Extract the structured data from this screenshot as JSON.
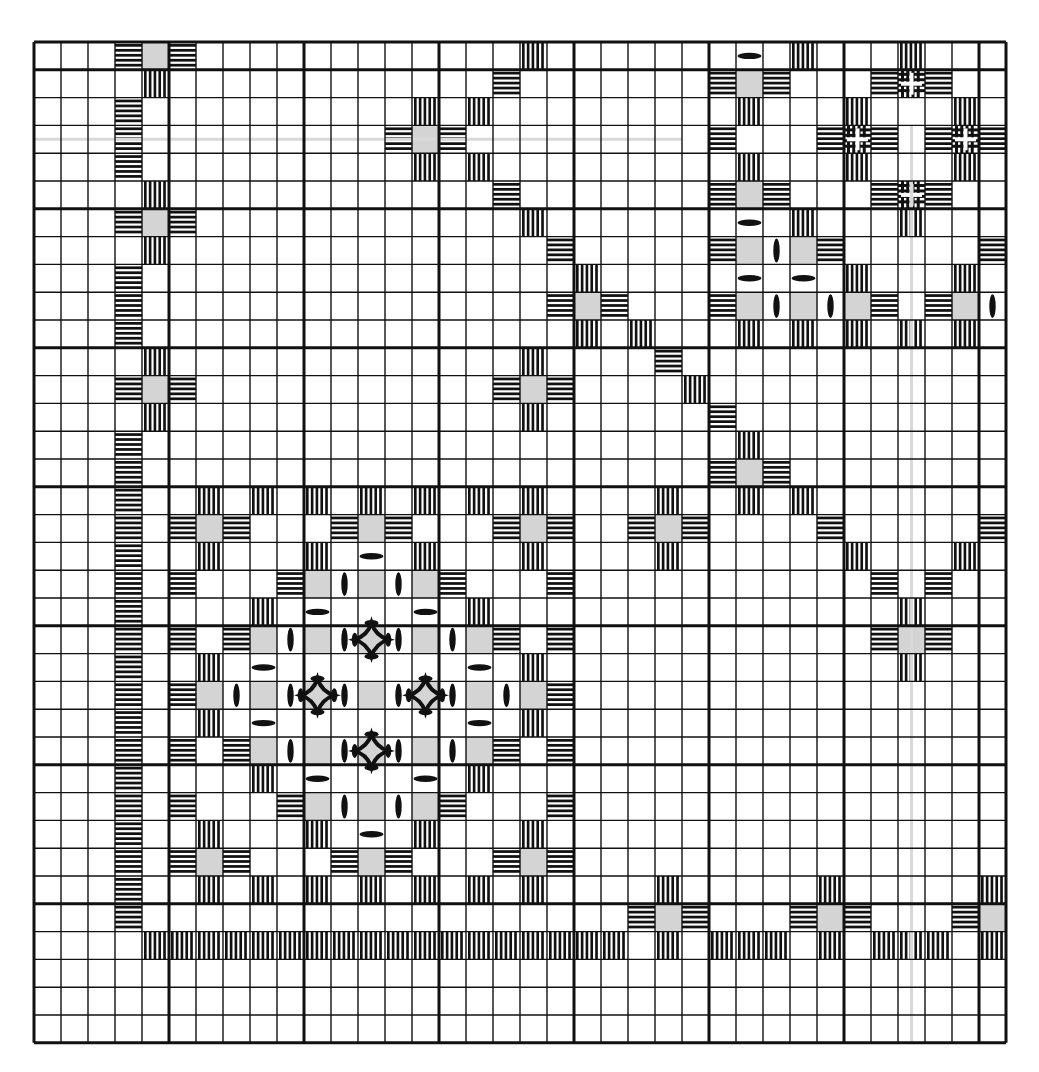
{
  "grid": {
    "cols": 36,
    "rows": 36,
    "origin_x": 34,
    "origin_y": 42,
    "cell_w": 27.0,
    "cell_h": 27.8,
    "major_col_lines": [
      0,
      5,
      10,
      15,
      20,
      25,
      30,
      35,
      36
    ],
    "major_row_lines": [
      0,
      1,
      6,
      11,
      16,
      21,
      26,
      31,
      36
    ],
    "line_color": "#111111",
    "paper_color": "#ffffff"
  },
  "colors": {
    "ink": "#111111",
    "cut": "#d4d4d4",
    "guide": "#d9d9d9"
  },
  "stitch_legend": {
    "H": "kloster block horizontal",
    "V": "kloster block vertical",
    "G": "cut square",
    "E": "woven bar vertical",
    "O": "woven bar horizontal",
    "X": "dove's eye",
    "D": "large dove's eye"
  },
  "guides": [
    {
      "orient": "h",
      "row": 3.5,
      "from_col": 0,
      "to_col": 24
    },
    {
      "orient": "v",
      "col": 32.5,
      "from_row": 3,
      "to_row": 36
    }
  ],
  "cells": [
    [
      0,
      3,
      "H"
    ],
    [
      0,
      4,
      "G"
    ],
    [
      0,
      5,
      "H"
    ],
    [
      0,
      18,
      "V"
    ],
    [
      0,
      26,
      "O"
    ],
    [
      0,
      28,
      "V"
    ],
    [
      0,
      32,
      "V"
    ],
    [
      1,
      4,
      "V"
    ],
    [
      1,
      17,
      "H"
    ],
    [
      1,
      25,
      "H"
    ],
    [
      1,
      26,
      "G"
    ],
    [
      1,
      27,
      "H"
    ],
    [
      1,
      31,
      "H"
    ],
    [
      1,
      32,
      "X"
    ],
    [
      1,
      33,
      "H"
    ],
    [
      2,
      3,
      "H"
    ],
    [
      2,
      14,
      "V"
    ],
    [
      2,
      16,
      "V"
    ],
    [
      2,
      26,
      "V"
    ],
    [
      2,
      30,
      "V"
    ],
    [
      2,
      34,
      "V"
    ],
    [
      3,
      3,
      "H"
    ],
    [
      3,
      13,
      "H"
    ],
    [
      3,
      14,
      "G"
    ],
    [
      3,
      15,
      "H"
    ],
    [
      3,
      25,
      "H"
    ],
    [
      3,
      29,
      "H"
    ],
    [
      3,
      30,
      "X"
    ],
    [
      3,
      31,
      "H"
    ],
    [
      3,
      33,
      "H"
    ],
    [
      3,
      34,
      "X"
    ],
    [
      3,
      35,
      "H"
    ],
    [
      4,
      3,
      "H"
    ],
    [
      4,
      14,
      "V"
    ],
    [
      4,
      16,
      "V"
    ],
    [
      4,
      26,
      "V"
    ],
    [
      4,
      30,
      "V"
    ],
    [
      4,
      34,
      "V"
    ],
    [
      5,
      4,
      "V"
    ],
    [
      5,
      17,
      "H"
    ],
    [
      5,
      25,
      "H"
    ],
    [
      5,
      26,
      "G"
    ],
    [
      5,
      27,
      "H"
    ],
    [
      5,
      31,
      "H"
    ],
    [
      5,
      32,
      "X"
    ],
    [
      5,
      33,
      "H"
    ],
    [
      6,
      3,
      "H"
    ],
    [
      6,
      4,
      "G"
    ],
    [
      6,
      5,
      "H"
    ],
    [
      6,
      18,
      "V"
    ],
    [
      6,
      26,
      "O"
    ],
    [
      6,
      28,
      "V"
    ],
    [
      6,
      32,
      "V"
    ],
    [
      7,
      4,
      "V"
    ],
    [
      7,
      19,
      "H"
    ],
    [
      7,
      25,
      "H"
    ],
    [
      7,
      26,
      "G"
    ],
    [
      7,
      27,
      "E"
    ],
    [
      7,
      28,
      "G"
    ],
    [
      7,
      29,
      "H"
    ],
    [
      7,
      35,
      "H"
    ],
    [
      8,
      3,
      "H"
    ],
    [
      8,
      20,
      "V"
    ],
    [
      8,
      26,
      "O"
    ],
    [
      8,
      28,
      "O"
    ],
    [
      8,
      30,
      "V"
    ],
    [
      8,
      34,
      "V"
    ],
    [
      9,
      3,
      "H"
    ],
    [
      9,
      19,
      "H"
    ],
    [
      9,
      20,
      "G"
    ],
    [
      9,
      21,
      "H"
    ],
    [
      9,
      25,
      "H"
    ],
    [
      9,
      26,
      "G"
    ],
    [
      9,
      27,
      "E"
    ],
    [
      9,
      28,
      "G"
    ],
    [
      9,
      29,
      "E"
    ],
    [
      9,
      30,
      "G"
    ],
    [
      9,
      31,
      "H"
    ],
    [
      9,
      33,
      "H"
    ],
    [
      9,
      34,
      "G"
    ],
    [
      9,
      35,
      "E"
    ],
    [
      10,
      3,
      "H"
    ],
    [
      10,
      20,
      "V"
    ],
    [
      10,
      22,
      "V"
    ],
    [
      10,
      26,
      "V"
    ],
    [
      10,
      28,
      "V"
    ],
    [
      10,
      30,
      "V"
    ],
    [
      10,
      32,
      "V"
    ],
    [
      10,
      34,
      "V"
    ],
    [
      11,
      4,
      "V"
    ],
    [
      11,
      18,
      "V"
    ],
    [
      11,
      23,
      "H"
    ],
    [
      12,
      3,
      "H"
    ],
    [
      12,
      4,
      "G"
    ],
    [
      12,
      5,
      "H"
    ],
    [
      12,
      17,
      "H"
    ],
    [
      12,
      18,
      "G"
    ],
    [
      12,
      19,
      "H"
    ],
    [
      12,
      24,
      "V"
    ],
    [
      13,
      4,
      "V"
    ],
    [
      13,
      18,
      "V"
    ],
    [
      13,
      25,
      "H"
    ],
    [
      14,
      3,
      "H"
    ],
    [
      14,
      26,
      "V"
    ],
    [
      15,
      3,
      "H"
    ],
    [
      15,
      25,
      "H"
    ],
    [
      15,
      26,
      "G"
    ],
    [
      15,
      27,
      "H"
    ],
    [
      16,
      3,
      "H"
    ],
    [
      16,
      6,
      "V"
    ],
    [
      16,
      8,
      "V"
    ],
    [
      16,
      10,
      "V"
    ],
    [
      16,
      12,
      "V"
    ],
    [
      16,
      14,
      "V"
    ],
    [
      16,
      16,
      "V"
    ],
    [
      16,
      18,
      "V"
    ],
    [
      16,
      23,
      "V"
    ],
    [
      16,
      26,
      "V"
    ],
    [
      16,
      28,
      "V"
    ],
    [
      17,
      3,
      "H"
    ],
    [
      17,
      5,
      "H"
    ],
    [
      17,
      6,
      "G"
    ],
    [
      17,
      7,
      "H"
    ],
    [
      17,
      11,
      "H"
    ],
    [
      17,
      12,
      "G"
    ],
    [
      17,
      13,
      "H"
    ],
    [
      17,
      17,
      "H"
    ],
    [
      17,
      18,
      "G"
    ],
    [
      17,
      19,
      "H"
    ],
    [
      17,
      22,
      "H"
    ],
    [
      17,
      23,
      "G"
    ],
    [
      17,
      24,
      "H"
    ],
    [
      17,
      29,
      "H"
    ],
    [
      17,
      35,
      "H"
    ],
    [
      18,
      3,
      "H"
    ],
    [
      18,
      6,
      "V"
    ],
    [
      18,
      10,
      "V"
    ],
    [
      18,
      12,
      "O"
    ],
    [
      18,
      14,
      "V"
    ],
    [
      18,
      18,
      "V"
    ],
    [
      18,
      23,
      "V"
    ],
    [
      18,
      30,
      "V"
    ],
    [
      18,
      34,
      "V"
    ],
    [
      19,
      3,
      "H"
    ],
    [
      19,
      5,
      "H"
    ],
    [
      19,
      9,
      "H"
    ],
    [
      19,
      10,
      "G"
    ],
    [
      19,
      11,
      "E"
    ],
    [
      19,
      12,
      "G"
    ],
    [
      19,
      13,
      "E"
    ],
    [
      19,
      14,
      "G"
    ],
    [
      19,
      15,
      "H"
    ],
    [
      19,
      19,
      "H"
    ],
    [
      19,
      31,
      "H"
    ],
    [
      19,
      33,
      "H"
    ],
    [
      20,
      3,
      "H"
    ],
    [
      20,
      8,
      "V"
    ],
    [
      20,
      10,
      "O"
    ],
    [
      20,
      14,
      "O"
    ],
    [
      20,
      16,
      "V"
    ],
    [
      20,
      32,
      "V"
    ],
    [
      21,
      3,
      "H"
    ],
    [
      21,
      5,
      "H"
    ],
    [
      21,
      7,
      "H"
    ],
    [
      21,
      8,
      "G"
    ],
    [
      21,
      9,
      "E"
    ],
    [
      21,
      10,
      "G"
    ],
    [
      21,
      11,
      "E"
    ],
    [
      21,
      12,
      "D"
    ],
    [
      21,
      13,
      "E"
    ],
    [
      21,
      14,
      "G"
    ],
    [
      21,
      15,
      "E"
    ],
    [
      21,
      16,
      "G"
    ],
    [
      21,
      17,
      "H"
    ],
    [
      21,
      19,
      "H"
    ],
    [
      21,
      31,
      "H"
    ],
    [
      21,
      32,
      "G"
    ],
    [
      21,
      33,
      "H"
    ],
    [
      22,
      3,
      "H"
    ],
    [
      22,
      6,
      "V"
    ],
    [
      22,
      8,
      "O"
    ],
    [
      22,
      16,
      "O"
    ],
    [
      22,
      18,
      "V"
    ],
    [
      22,
      32,
      "V"
    ],
    [
      23,
      3,
      "H"
    ],
    [
      23,
      5,
      "H"
    ],
    [
      23,
      6,
      "G"
    ],
    [
      23,
      7,
      "E"
    ],
    [
      23,
      8,
      "G"
    ],
    [
      23,
      9,
      "E"
    ],
    [
      23,
      10,
      "D"
    ],
    [
      23,
      11,
      "E"
    ],
    [
      23,
      12,
      "G"
    ],
    [
      23,
      13,
      "E"
    ],
    [
      23,
      14,
      "D"
    ],
    [
      23,
      15,
      "E"
    ],
    [
      23,
      16,
      "G"
    ],
    [
      23,
      17,
      "E"
    ],
    [
      23,
      18,
      "G"
    ],
    [
      23,
      19,
      "H"
    ],
    [
      24,
      3,
      "H"
    ],
    [
      24,
      6,
      "V"
    ],
    [
      24,
      8,
      "O"
    ],
    [
      24,
      16,
      "O"
    ],
    [
      24,
      18,
      "V"
    ],
    [
      25,
      3,
      "H"
    ],
    [
      25,
      5,
      "H"
    ],
    [
      25,
      7,
      "H"
    ],
    [
      25,
      8,
      "G"
    ],
    [
      25,
      9,
      "E"
    ],
    [
      25,
      10,
      "G"
    ],
    [
      25,
      11,
      "E"
    ],
    [
      25,
      12,
      "D"
    ],
    [
      25,
      13,
      "E"
    ],
    [
      25,
      14,
      "G"
    ],
    [
      25,
      15,
      "E"
    ],
    [
      25,
      16,
      "G"
    ],
    [
      25,
      17,
      "H"
    ],
    [
      25,
      19,
      "H"
    ],
    [
      26,
      3,
      "H"
    ],
    [
      26,
      8,
      "V"
    ],
    [
      26,
      10,
      "O"
    ],
    [
      26,
      14,
      "O"
    ],
    [
      26,
      16,
      "V"
    ],
    [
      27,
      3,
      "H"
    ],
    [
      27,
      5,
      "H"
    ],
    [
      27,
      9,
      "H"
    ],
    [
      27,
      10,
      "G"
    ],
    [
      27,
      11,
      "E"
    ],
    [
      27,
      12,
      "G"
    ],
    [
      27,
      13,
      "E"
    ],
    [
      27,
      14,
      "G"
    ],
    [
      27,
      15,
      "H"
    ],
    [
      27,
      19,
      "H"
    ],
    [
      28,
      3,
      "H"
    ],
    [
      28,
      6,
      "V"
    ],
    [
      28,
      10,
      "V"
    ],
    [
      28,
      12,
      "O"
    ],
    [
      28,
      14,
      "V"
    ],
    [
      28,
      18,
      "V"
    ],
    [
      29,
      3,
      "H"
    ],
    [
      29,
      5,
      "H"
    ],
    [
      29,
      6,
      "G"
    ],
    [
      29,
      7,
      "H"
    ],
    [
      29,
      11,
      "H"
    ],
    [
      29,
      12,
      "G"
    ],
    [
      29,
      13,
      "H"
    ],
    [
      29,
      17,
      "H"
    ],
    [
      29,
      18,
      "G"
    ],
    [
      29,
      19,
      "H"
    ],
    [
      30,
      3,
      "H"
    ],
    [
      30,
      6,
      "V"
    ],
    [
      30,
      8,
      "V"
    ],
    [
      30,
      10,
      "V"
    ],
    [
      30,
      12,
      "V"
    ],
    [
      30,
      14,
      "V"
    ],
    [
      30,
      16,
      "V"
    ],
    [
      30,
      18,
      "V"
    ],
    [
      30,
      23,
      "V"
    ],
    [
      30,
      29,
      "V"
    ],
    [
      30,
      35,
      "V"
    ],
    [
      31,
      3,
      "H"
    ],
    [
      31,
      22,
      "H"
    ],
    [
      31,
      23,
      "G"
    ],
    [
      31,
      24,
      "H"
    ],
    [
      31,
      28,
      "H"
    ],
    [
      31,
      29,
      "G"
    ],
    [
      31,
      30,
      "H"
    ],
    [
      31,
      34,
      "H"
    ],
    [
      31,
      35,
      "G"
    ],
    [
      32,
      4,
      "V"
    ],
    [
      32,
      5,
      "V"
    ],
    [
      32,
      6,
      "V"
    ],
    [
      32,
      7,
      "V"
    ],
    [
      32,
      8,
      "V"
    ],
    [
      32,
      9,
      "V"
    ],
    [
      32,
      10,
      "V"
    ],
    [
      32,
      11,
      "V"
    ],
    [
      32,
      12,
      "V"
    ],
    [
      32,
      13,
      "V"
    ],
    [
      32,
      14,
      "V"
    ],
    [
      32,
      15,
      "V"
    ],
    [
      32,
      16,
      "V"
    ],
    [
      32,
      17,
      "V"
    ],
    [
      32,
      18,
      "V"
    ],
    [
      32,
      19,
      "V"
    ],
    [
      32,
      20,
      "V"
    ],
    [
      32,
      21,
      "V"
    ],
    [
      32,
      23,
      "V"
    ],
    [
      32,
      25,
      "V"
    ],
    [
      32,
      26,
      "V"
    ],
    [
      32,
      27,
      "V"
    ],
    [
      32,
      29,
      "V"
    ],
    [
      32,
      31,
      "V"
    ],
    [
      32,
      32,
      "V"
    ],
    [
      32,
      33,
      "V"
    ],
    [
      32,
      35,
      "V"
    ]
  ]
}
